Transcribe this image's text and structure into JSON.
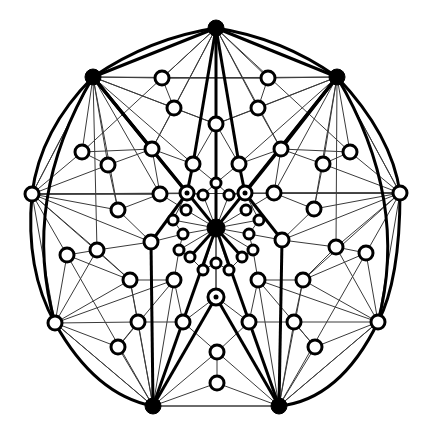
{
  "diagram": {
    "colors": {
      "background": "#ffffff",
      "stroke": "#000000",
      "thin_edge": "#3a3a3a"
    },
    "black_nodes": [
      {
        "id": "T",
        "x": 216,
        "y": 28,
        "r": 8
      },
      {
        "id": "UL",
        "x": 93,
        "y": 77,
        "r": 8
      },
      {
        "id": "UR",
        "x": 337,
        "y": 77,
        "r": 8
      },
      {
        "id": "C",
        "x": 216,
        "y": 228,
        "r": 9
      },
      {
        "id": "BL",
        "x": 153,
        "y": 406,
        "r": 8
      },
      {
        "id": "BR",
        "x": 279,
        "y": 406,
        "r": 8
      }
    ],
    "white_nodes": [
      {
        "id": "a1",
        "x": 162,
        "y": 78,
        "r": 7
      },
      {
        "id": "a2",
        "x": 268,
        "y": 78,
        "r": 7
      },
      {
        "id": "a3",
        "x": 174,
        "y": 108,
        "r": 7
      },
      {
        "id": "a4",
        "x": 258,
        "y": 108,
        "r": 7
      },
      {
        "id": "a5",
        "x": 216,
        "y": 124,
        "r": 7
      },
      {
        "id": "b1",
        "x": 152,
        "y": 149,
        "r": 7
      },
      {
        "id": "b2",
        "x": 281,
        "y": 149,
        "r": 7
      },
      {
        "id": "b3",
        "x": 82,
        "y": 152,
        "r": 7
      },
      {
        "id": "b4",
        "x": 350,
        "y": 152,
        "r": 7
      },
      {
        "id": "b5",
        "x": 108,
        "y": 165,
        "r": 7
      },
      {
        "id": "b6",
        "x": 323,
        "y": 164,
        "r": 7
      },
      {
        "id": "b7",
        "x": 193,
        "y": 164,
        "r": 7
      },
      {
        "id": "b8",
        "x": 239,
        "y": 164,
        "r": 7
      },
      {
        "id": "c1",
        "x": 32,
        "y": 194,
        "r": 7
      },
      {
        "id": "c2",
        "x": 400,
        "y": 193,
        "r": 7
      },
      {
        "id": "c3",
        "x": 160,
        "y": 194,
        "r": 7
      },
      {
        "id": "c4",
        "x": 274,
        "y": 193,
        "r": 7
      },
      {
        "id": "c5",
        "x": 118,
        "y": 210,
        "r": 7
      },
      {
        "id": "c6",
        "x": 314,
        "y": 209,
        "r": 7
      },
      {
        "id": "d1",
        "x": 67,
        "y": 255,
        "r": 7
      },
      {
        "id": "d2",
        "x": 366,
        "y": 253,
        "r": 7
      },
      {
        "id": "d3",
        "x": 97,
        "y": 250,
        "r": 7
      },
      {
        "id": "d4",
        "x": 336,
        "y": 247,
        "r": 7
      },
      {
        "id": "d5",
        "x": 151,
        "y": 242,
        "r": 7
      },
      {
        "id": "d6",
        "x": 282,
        "y": 240,
        "r": 7
      },
      {
        "id": "e1",
        "x": 130,
        "y": 280,
        "r": 7
      },
      {
        "id": "e2",
        "x": 303,
        "y": 280,
        "r": 7
      },
      {
        "id": "e3",
        "x": 174,
        "y": 280,
        "r": 7
      },
      {
        "id": "e4",
        "x": 258,
        "y": 280,
        "r": 7
      },
      {
        "id": "f1",
        "x": 55,
        "y": 323,
        "r": 7
      },
      {
        "id": "f2",
        "x": 378,
        "y": 322,
        "r": 7
      },
      {
        "id": "f3",
        "x": 138,
        "y": 322,
        "r": 7
      },
      {
        "id": "f4",
        "x": 294,
        "y": 322,
        "r": 7
      },
      {
        "id": "f5",
        "x": 183,
        "y": 322,
        "r": 7
      },
      {
        "id": "f6",
        "x": 249,
        "y": 322,
        "r": 7
      },
      {
        "id": "g1",
        "x": 118,
        "y": 347,
        "r": 7
      },
      {
        "id": "g2",
        "x": 315,
        "y": 347,
        "r": 7
      },
      {
        "id": "g3",
        "x": 217,
        "y": 352,
        "r": 7
      },
      {
        "id": "g4",
        "x": 217,
        "y": 383,
        "r": 7
      }
    ],
    "small_nodes": [
      {
        "id": "s1",
        "x": 216,
        "y": 183,
        "r": 5
      },
      {
        "id": "s2",
        "x": 203,
        "y": 195,
        "r": 5
      },
      {
        "id": "s3",
        "x": 229,
        "y": 195,
        "r": 5
      },
      {
        "id": "s4",
        "x": 186,
        "y": 210,
        "r": 5
      },
      {
        "id": "s5",
        "x": 246,
        "y": 210,
        "r": 5
      },
      {
        "id": "s6",
        "x": 173,
        "y": 220,
        "r": 5
      },
      {
        "id": "s7",
        "x": 259,
        "y": 220,
        "r": 5
      },
      {
        "id": "s8",
        "x": 183,
        "y": 234,
        "r": 5
      },
      {
        "id": "s9",
        "x": 249,
        "y": 234,
        "r": 5
      },
      {
        "id": "s10",
        "x": 179,
        "y": 250,
        "r": 5
      },
      {
        "id": "s11",
        "x": 253,
        "y": 250,
        "r": 5
      },
      {
        "id": "s12",
        "x": 190,
        "y": 257,
        "r": 5
      },
      {
        "id": "s13",
        "x": 242,
        "y": 257,
        "r": 5
      },
      {
        "id": "s14",
        "x": 203,
        "y": 270,
        "r": 5
      },
      {
        "id": "s15",
        "x": 229,
        "y": 270,
        "r": 5
      },
      {
        "id": "s16",
        "x": 216,
        "y": 263,
        "r": 5
      }
    ],
    "dotted_nodes": [
      {
        "id": "p1",
        "x": 187,
        "y": 193,
        "r": 7
      },
      {
        "id": "p2",
        "x": 245,
        "y": 193,
        "r": 7
      },
      {
        "id": "p3",
        "x": 216,
        "y": 297,
        "r": 8
      }
    ],
    "thick_edges": [
      [
        "T",
        "UL"
      ],
      [
        "T",
        "UR"
      ],
      [
        "T",
        "C"
      ],
      [
        "UL",
        "C"
      ],
      [
        "UR",
        "C"
      ],
      [
        "T",
        "b7"
      ],
      [
        "T",
        "b8"
      ],
      [
        "UL",
        "b1"
      ],
      [
        "UR",
        "b2"
      ],
      [
        "UL",
        "p1"
      ],
      [
        "UR",
        "p2"
      ],
      [
        "C",
        "BL"
      ],
      [
        "C",
        "BR"
      ],
      [
        "p1",
        "d5"
      ],
      [
        "p2",
        "d6"
      ],
      [
        "d5",
        "BL"
      ],
      [
        "d6",
        "BR"
      ],
      [
        "p3",
        "BL"
      ],
      [
        "p3",
        "BR"
      ],
      [
        "b7",
        "p1"
      ],
      [
        "b8",
        "p2"
      ],
      [
        "C",
        "s12"
      ],
      [
        "C",
        "s13"
      ]
    ],
    "outer_arcs": [
      "M93,77 Q150,38 216,28",
      "M216,28 Q282,38 337,77",
      "M93,77 Q40,130 32,194",
      "M337,77 Q392,135 400,193",
      "M32,194 Q25,270 55,323",
      "M400,193 Q400,280 378,322",
      "M55,323 Q95,395 153,406",
      "M378,322 Q340,400 279,406",
      "M93,77 Q20,200 55,323",
      "M337,77 Q410,200 378,322"
    ],
    "hub_thin_edges": {
      "T": [
        "a1",
        "a2",
        "a3",
        "a4",
        "a5",
        "b1",
        "b2",
        "b3",
        "b4"
      ],
      "UL": [
        "a1",
        "a3",
        "a5",
        "b3",
        "b5",
        "b7",
        "c1",
        "c3",
        "c5",
        "d3",
        "a2"
      ],
      "UR": [
        "a2",
        "a4",
        "a5",
        "b4",
        "b6",
        "b8",
        "c2",
        "c4",
        "c6",
        "d4",
        "a1"
      ],
      "C": [
        "s1",
        "s2",
        "s3",
        "s4",
        "s5",
        "s6",
        "s7",
        "s8",
        "s9",
        "s10",
        "s11",
        "s14",
        "s15",
        "s16",
        "p3",
        "p1",
        "p2"
      ],
      "BL": [
        "f1",
        "f3",
        "f5",
        "g1",
        "g3",
        "g4",
        "e1",
        "e3",
        "d1",
        "BR"
      ],
      "BR": [
        "f2",
        "f4",
        "f6",
        "g2",
        "g3",
        "g4",
        "e2",
        "e4",
        "d2"
      ],
      "c1": [
        "b3",
        "b5",
        "c3",
        "c5",
        "d1",
        "d3",
        "d5",
        "e1",
        "p1",
        "UL",
        "f1"
      ],
      "c2": [
        "b4",
        "b6",
        "c4",
        "c6",
        "d2",
        "d4",
        "d6",
        "e2",
        "p2",
        "UR",
        "f2"
      ],
      "f1": [
        "d1",
        "d3",
        "e1",
        "f3",
        "g1",
        "e3",
        "BL"
      ],
      "f2": [
        "d2",
        "d4",
        "e2",
        "f4",
        "g2",
        "e4",
        "BR"
      ]
    },
    "misc_thin_edges": [
      [
        "a1",
        "a3"
      ],
      [
        "a2",
        "a4"
      ],
      [
        "a3",
        "a5"
      ],
      [
        "a4",
        "a5"
      ],
      [
        "a3",
        "b1"
      ],
      [
        "a4",
        "b2"
      ],
      [
        "a5",
        "b7"
      ],
      [
        "a5",
        "b8"
      ],
      [
        "b1",
        "b7"
      ],
      [
        "b2",
        "b8"
      ],
      [
        "b3",
        "b5"
      ],
      [
        "b4",
        "b6"
      ],
      [
        "b5",
        "c5"
      ],
      [
        "b6",
        "c6"
      ],
      [
        "b1",
        "c3"
      ],
      [
        "b2",
        "c4"
      ],
      [
        "c3",
        "s4"
      ],
      [
        "c4",
        "s5"
      ],
      [
        "c5",
        "d5"
      ],
      [
        "c6",
        "d6"
      ],
      [
        "d3",
        "e1"
      ],
      [
        "d4",
        "e2"
      ],
      [
        "e1",
        "f3"
      ],
      [
        "e2",
        "f4"
      ],
      [
        "e3",
        "f5"
      ],
      [
        "e4",
        "f6"
      ],
      [
        "f5",
        "g3"
      ],
      [
        "f6",
        "g3"
      ],
      [
        "g3",
        "g4"
      ],
      [
        "f3",
        "g1"
      ],
      [
        "f4",
        "g2"
      ],
      [
        "p1",
        "s2"
      ],
      [
        "p2",
        "s3"
      ],
      [
        "s2",
        "s1"
      ],
      [
        "s3",
        "s1"
      ],
      [
        "p1",
        "s6"
      ],
      [
        "p2",
        "s7"
      ],
      [
        "s6",
        "s8"
      ],
      [
        "s7",
        "s9"
      ],
      [
        "s8",
        "s10"
      ],
      [
        "s9",
        "s11"
      ],
      [
        "s10",
        "s12"
      ],
      [
        "s11",
        "s13"
      ],
      [
        "s12",
        "s14"
      ],
      [
        "s13",
        "s15"
      ],
      [
        "s14",
        "s16"
      ],
      [
        "s15",
        "s16"
      ],
      [
        "s16",
        "p3"
      ],
      [
        "e3",
        "s10"
      ],
      [
        "e4",
        "s11"
      ],
      [
        "d5",
        "s8"
      ],
      [
        "d6",
        "s9"
      ],
      [
        "b7",
        "s1"
      ],
      [
        "b8",
        "s1"
      ],
      [
        "c3",
        "c1"
      ],
      [
        "c4",
        "c2"
      ],
      [
        "d1",
        "d3"
      ],
      [
        "d2",
        "d4"
      ],
      [
        "d3",
        "d5"
      ],
      [
        "d4",
        "d6"
      ],
      [
        "b3",
        "b1"
      ],
      [
        "b4",
        "b2"
      ],
      [
        "b5",
        "b1"
      ],
      [
        "b6",
        "b2"
      ],
      [
        "c5",
        "c3"
      ],
      [
        "c6",
        "c4"
      ],
      [
        "c1",
        "c2"
      ],
      [
        "BL",
        "BR"
      ],
      [
        "a1",
        "a2"
      ],
      [
        "e1",
        "e3"
      ],
      [
        "e2",
        "e4"
      ],
      [
        "g1",
        "e3"
      ],
      [
        "g2",
        "e4"
      ],
      [
        "d1",
        "e1"
      ],
      [
        "d2",
        "e2"
      ],
      [
        "f3",
        "f5"
      ],
      [
        "f4",
        "f6"
      ],
      [
        "p3",
        "f5"
      ],
      [
        "p3",
        "f6"
      ]
    ]
  }
}
